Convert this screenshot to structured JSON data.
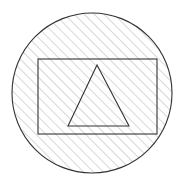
{
  "canvas": {
    "width": 183,
    "height": 187,
    "background": "#ffffff",
    "title": "Hatched circle containing a rectangle and a triangle"
  },
  "style": {
    "outline_color": "#333333",
    "outline_width": 1.1,
    "hatch_color": "#9a9a9a",
    "hatch_width": 0.8,
    "hatch_spacing": 7,
    "hatch_angle_deg": 45,
    "fill": "none"
  },
  "shapes": {
    "circle": {
      "label": "circle",
      "cx": 92,
      "cy": 93,
      "r": 80,
      "stroke": "#333333",
      "fill": "none",
      "hatched": true
    },
    "rectangle": {
      "label": "rectangle",
      "x": 38,
      "y": 59,
      "width": 119,
      "height": 75,
      "stroke": "#333333",
      "fill": "none",
      "hatched": false
    },
    "triangle": {
      "label": "triangle",
      "points": "97,65 129,126 68,126",
      "apex_x": 97,
      "apex_y": 65,
      "base_left_x": 68,
      "base_left_y": 126,
      "base_right_x": 129,
      "base_right_y": 126,
      "stroke": "#333333",
      "fill": "none",
      "hatched": false
    }
  }
}
